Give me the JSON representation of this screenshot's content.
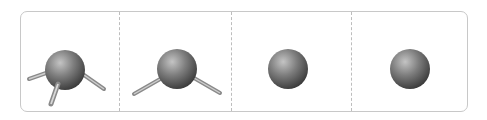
{
  "figure": {
    "colors": {
      "frame_border": "#c8c8c8",
      "divider": "#bdbdbd",
      "sphere_light": "#bcbcbc",
      "sphere_mid": "#7a7a7a",
      "sphere_dark": "#3a3a3a",
      "stick_dark": "#6e6e6e",
      "stick_light": "#c9c9c9"
    },
    "panels": [
      {
        "id": "tetrahedral",
        "bonds": "four single bonds",
        "icon": "tetrahedral-molecule-icon"
      },
      {
        "id": "trigonal-planar",
        "bonds": "one double bond, two single bonds",
        "icon": "trigonal-planar-molecule-icon"
      },
      {
        "id": "linear-double",
        "bonds": "two double bonds",
        "icon": "linear-double-bond-molecule-icon"
      },
      {
        "id": "linear-triple",
        "bonds": "one triple bond, one single bond",
        "icon": "linear-triple-bond-molecule-icon"
      }
    ]
  }
}
